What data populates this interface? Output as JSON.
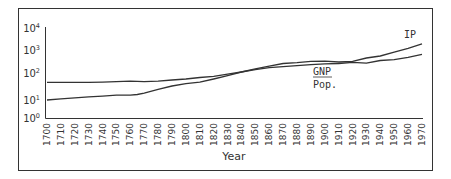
{
  "chart_data": {
    "type": "line",
    "title": "",
    "xlabel": "Year",
    "ylabel": "",
    "y_scale": "log",
    "ylim": [
      1,
      10000
    ],
    "xlim": [
      1700,
      1970
    ],
    "y_ticks": [
      {
        "base": "10",
        "exp": "0",
        "value": 1
      },
      {
        "base": "10",
        "exp": "1",
        "value": 10
      },
      {
        "base": "10",
        "exp": "2",
        "value": 100
      },
      {
        "base": "10",
        "exp": "3",
        "value": 1000
      },
      {
        "base": "10",
        "exp": "4",
        "value": 10000
      }
    ],
    "x_ticks": [
      "1700",
      "1710",
      "1720",
      "1730",
      "1740",
      "1750",
      "1760",
      "1770",
      "1780",
      "1790",
      "1800",
      "1810",
      "1820",
      "1830",
      "1840",
      "1850",
      "1860",
      "1870",
      "1880",
      "1890",
      "1900",
      "1910",
      "1920",
      "1930",
      "1940",
      "1950",
      "1960",
      "1970"
    ],
    "grid": false,
    "legend": "inline labels",
    "series": [
      {
        "name": "IP",
        "x": [
          1700,
          1710,
          1720,
          1730,
          1740,
          1750,
          1760,
          1765,
          1770,
          1780,
          1790,
          1800,
          1810,
          1820,
          1830,
          1840,
          1850,
          1860,
          1870,
          1880,
          1890,
          1900,
          1910,
          1920,
          1930,
          1940,
          1950,
          1960,
          1970
        ],
        "values": [
          10,
          11,
          12,
          13,
          14,
          15,
          15,
          16,
          18,
          25,
          33,
          40,
          46,
          60,
          80,
          110,
          150,
          200,
          260,
          280,
          320,
          330,
          300,
          320,
          450,
          550,
          800,
          1200,
          1900
        ]
      },
      {
        "name": "GNP / Pop.",
        "x": [
          1700,
          1710,
          1720,
          1730,
          1740,
          1750,
          1760,
          1770,
          1780,
          1790,
          1800,
          1810,
          1820,
          1830,
          1840,
          1850,
          1860,
          1870,
          1880,
          1890,
          1900,
          1910,
          1920,
          1930,
          1940,
          1950,
          1960,
          1970
        ],
        "values": [
          45,
          45,
          45,
          45,
          46,
          48,
          50,
          48,
          50,
          55,
          60,
          68,
          75,
          90,
          110,
          140,
          170,
          190,
          210,
          230,
          250,
          260,
          290,
          270,
          350,
          380,
          480,
          650
        ]
      }
    ],
    "annotations": [
      {
        "text": "IP",
        "near": "upper line end"
      },
      {
        "text": "GNP",
        "underlined": true,
        "near": "lower line end"
      },
      {
        "text": "Pop.",
        "near": "below GNP"
      }
    ]
  }
}
